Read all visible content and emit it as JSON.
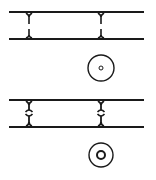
{
  "diagram": {
    "width": 156,
    "height": 180,
    "stroke_color": "#1a1a1a",
    "background": "#ffffff",
    "panels": [
      {
        "id": "top",
        "rails": {
          "x1": 9,
          "x2": 144,
          "y_top": 12,
          "y_bottom": 39
        },
        "connectors": [
          {
            "x": 29,
            "style": "split-gap"
          },
          {
            "x": 101,
            "style": "split-gap"
          }
        ],
        "symbol": {
          "type": "circle-with-dot",
          "cx": 101,
          "cy": 68,
          "r": 13,
          "inner_r": 2
        }
      },
      {
        "id": "bottom",
        "rails": {
          "x1": 9,
          "x2": 144,
          "y_top": 100,
          "y_bottom": 127
        },
        "connectors": [
          {
            "x": 29,
            "style": "split-bubble"
          },
          {
            "x": 101,
            "style": "split-bubble"
          }
        ],
        "symbol": {
          "type": "circle-with-ring",
          "cx": 101,
          "cy": 155,
          "r": 12,
          "inner_r": 4
        }
      }
    ]
  }
}
